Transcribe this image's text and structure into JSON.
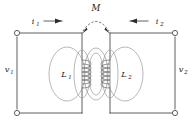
{
  "figure": {
    "kind": "circuit-schematic",
    "background_color": "#ffffff",
    "wire_color": "#4d4d4d",
    "flux_color": "#9a9a9a",
    "coil_color": "#6e6e6e",
    "label_color": "#1a1a1a",
    "dash_color": "#3a3a3a"
  },
  "labels": {
    "mutual_inductance": {
      "text": "M",
      "sub": ""
    },
    "current_left": {
      "text": "i",
      "sub": "1"
    },
    "current_right": {
      "text": "i",
      "sub": "2"
    },
    "voltage_left": {
      "text": "v",
      "sub": "1"
    },
    "voltage_right": {
      "text": "v",
      "sub": "2"
    },
    "inductor_left": {
      "text": "L",
      "sub": "1"
    },
    "inductor_right": {
      "text": "L",
      "sub": "2"
    }
  },
  "icons": {
    "arrow_right": "arrow-right-icon",
    "arrow_left": "arrow-left-icon",
    "terminal": "terminal-node-icon",
    "dashed_arc": "mutual-coupling-arc-icon",
    "coil": "coil-winding-icon",
    "flux_loop": "magnetic-flux-loop-icon"
  },
  "terminals": [
    {
      "name": "top-left",
      "x": 17,
      "y": 33
    },
    {
      "name": "bottom-left",
      "x": 17,
      "y": 113
    },
    {
      "name": "top-right",
      "x": 175,
      "y": 33
    },
    {
      "name": "bottom-right",
      "x": 175,
      "y": 113
    }
  ]
}
